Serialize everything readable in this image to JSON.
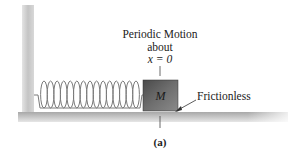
{
  "figure": {
    "label_line1": "Periodic Motion",
    "label_line2": "about",
    "label_line3": "x = 0",
    "mass_label": "M",
    "surface_label": "Frictionless",
    "caption": "(a)"
  },
  "components": {
    "wall": "vertical fixed wall",
    "spring": {
      "coils": 15
    },
    "block": "mass M",
    "floor": "horizontal frictionless surface"
  },
  "colors": {
    "wall": "#c8c8c8",
    "floor": "#b5b5b5",
    "block": "#5a5a5a",
    "spring": "#7a7a7a",
    "text": "#222222"
  }
}
